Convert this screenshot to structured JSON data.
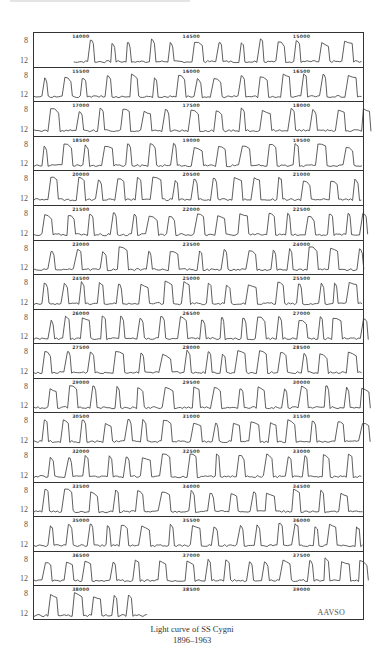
{
  "chart_data": {
    "type": "line",
    "title": "Light curve of SS Cygni",
    "subtitle": "1896–1963",
    "credit": "AAVSO",
    "xlabel": "Julian Date (2400000+)",
    "ylabel": "Visual magnitude",
    "ylim": [
      12,
      8
    ],
    "ytick_labels": [
      "8",
      "12"
    ],
    "grid": false,
    "legend": null,
    "layout": "17 stacked strips, each spanning 1500 days",
    "strips": [
      {
        "start": 13800,
        "end": 15300,
        "labels": [
          "14000",
          "14500",
          "15000"
        ]
      },
      {
        "start": 15300,
        "end": 16800,
        "labels": [
          "15500",
          "16000",
          "16500"
        ]
      },
      {
        "start": 16800,
        "end": 18300,
        "labels": [
          "17000",
          "17500",
          "18000"
        ]
      },
      {
        "start": 18300,
        "end": 19800,
        "labels": [
          "18500",
          "19000",
          "19500"
        ]
      },
      {
        "start": 19800,
        "end": 21300,
        "labels": [
          "20000",
          "20500",
          "21000"
        ]
      },
      {
        "start": 21300,
        "end": 22800,
        "labels": [
          "21500",
          "22000",
          "22500"
        ]
      },
      {
        "start": 22800,
        "end": 24300,
        "labels": [
          "23000",
          "23500",
          "24000"
        ]
      },
      {
        "start": 24300,
        "end": 25800,
        "labels": [
          "24500",
          "25000",
          "25500"
        ]
      },
      {
        "start": 25800,
        "end": 27300,
        "labels": [
          "26000",
          "26500",
          "27000"
        ]
      },
      {
        "start": 27300,
        "end": 28800,
        "labels": [
          "27500",
          "28000",
          "28500"
        ]
      },
      {
        "start": 28800,
        "end": 30300,
        "labels": [
          "29000",
          "29500",
          "30000"
        ]
      },
      {
        "start": 30300,
        "end": 31800,
        "labels": [
          "30500",
          "31000",
          "31500"
        ]
      },
      {
        "start": 31800,
        "end": 33300,
        "labels": [
          "32000",
          "32500",
          "33000"
        ]
      },
      {
        "start": 33300,
        "end": 34800,
        "labels": [
          "33500",
          "34000",
          "34500"
        ]
      },
      {
        "start": 34800,
        "end": 36300,
        "labels": [
          "35000",
          "35500",
          "36000"
        ]
      },
      {
        "start": 36300,
        "end": 37800,
        "labels": [
          "36500",
          "37000",
          "37500"
        ]
      },
      {
        "start": 37800,
        "end": 39300,
        "labels": [
          "38000",
          "38500",
          "39000"
        ],
        "data_ends_at": 38320
      }
    ],
    "series": [
      {
        "name": "SS Cygni visual magnitude",
        "quiescent_mag": 12,
        "outburst_peak_mag": 8.3,
        "typical_outburst_spacing_days": 50,
        "outburst_durations_days": [
          8,
          16
        ]
      }
    ]
  },
  "caption": {
    "line1": "Light curve of SS Cygni",
    "line2": "1896–1963"
  },
  "credit_label": "AAVSO",
  "axis": {
    "top": "8",
    "bottom": "12"
  }
}
